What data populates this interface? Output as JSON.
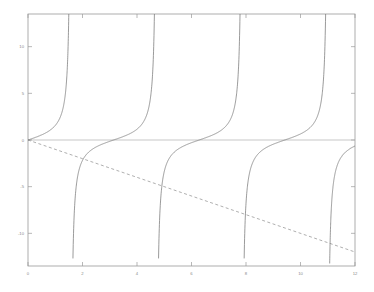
{
  "figure": {
    "background_color": "#ffffff",
    "frame_color": "#9a9a9a",
    "tick_label_color": "#8a8a8a"
  },
  "axes": {
    "frame": {
      "left": 28,
      "top": 14,
      "right": 355,
      "bottom": 266
    },
    "x_ticks": [
      {
        "value": 0,
        "label": "0"
      },
      {
        "value": 2,
        "label": "2"
      },
      {
        "value": 4,
        "label": "4"
      },
      {
        "value": 6,
        "label": "6"
      },
      {
        "value": 8,
        "label": "8"
      },
      {
        "value": 10,
        "label": "10"
      },
      {
        "value": 12,
        "label": "12"
      }
    ],
    "y_ticks": [
      {
        "value": 10,
        "label": "10"
      },
      {
        "value": 5,
        "label": "5"
      },
      {
        "value": 0,
        "label": "0"
      },
      {
        "value": -5,
        "label": "-5"
      },
      {
        "value": -10,
        "label": "-10"
      }
    ]
  },
  "chart_data": {
    "type": "line",
    "title": "",
    "xlabel": "",
    "ylabel": "",
    "xlim": [
      0,
      12
    ],
    "ylim": [
      -13.5,
      13.5
    ],
    "grid": false,
    "legend": null,
    "series": [
      {
        "name": "tan(x)",
        "style": "solid",
        "color": "#6f6f6f",
        "width": 0.7,
        "expression": "tan(x)",
        "asymptotes_x": [
          1.5708,
          4.7124,
          7.854,
          10.9956
        ],
        "zero_crossings_x": [
          0,
          3.1416,
          6.2832,
          9.4248
        ],
        "x": [
          0,
          0.5,
          1,
          1.2,
          1.4,
          1.5,
          1.7,
          1.9,
          2.2,
          2.6,
          3.1416,
          3.6,
          4,
          4.4,
          4.6,
          4.8,
          5,
          5.4,
          5.8,
          6.2832,
          6.8,
          7.2,
          7.6,
          7.8,
          8,
          8.2,
          8.6,
          9,
          9.4248,
          9.9,
          10.4,
          10.8,
          11,
          11.3,
          11.7,
          12
        ],
        "y": [
          0,
          0.546,
          1.557,
          2.572,
          5.798,
          14.101,
          -7.697,
          -2.927,
          -1.374,
          -0.602,
          0,
          0.493,
          1.158,
          3.096,
          8.86,
          -11.385,
          -3.381,
          -1.374,
          -0.439,
          0,
          0.494,
          0.871,
          1.578,
          2.351,
          6.8,
          -3.4,
          -1.14,
          -0.452,
          0,
          0.56,
          1.57,
          4.82,
          -8.2,
          -2.3,
          -1.07,
          -0.636
        ]
      },
      {
        "name": "-x",
        "style": "dashed",
        "color": "#8c8c8c",
        "width": 0.7,
        "expression": "-x",
        "points": [
          [
            0,
            0
          ],
          [
            12,
            -12
          ]
        ]
      },
      {
        "name": "zero-line",
        "style": "solid",
        "color": "#b0b0b0",
        "width": 0.7,
        "expression": "0",
        "points": [
          [
            0,
            0
          ],
          [
            12,
            0
          ]
        ]
      }
    ]
  }
}
